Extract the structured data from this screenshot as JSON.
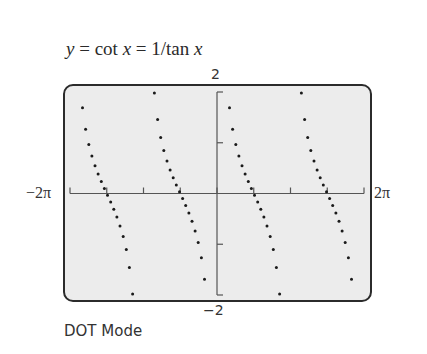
{
  "title_parts": {
    "y": "y",
    "eq1": " = cot ",
    "x1": "x",
    "eq2": " = 1/tan ",
    "x2": "x"
  },
  "caption": "DOT Mode",
  "axis_labels": {
    "ymax": "2",
    "ymin": "−2",
    "xmin": "−2π",
    "xmax": "2π"
  },
  "colors": {
    "screen_bg": "#ececec",
    "frame": "#2b2b2b",
    "axis": "#555555",
    "dot": "#1a1a1a"
  },
  "chart_data": {
    "type": "scatter",
    "title": "y = cot x = 1/tan x",
    "subtitle": "DOT Mode",
    "function": "cot(x)",
    "xlabel": "",
    "ylabel": "",
    "xlim": [
      -6.2832,
      6.2832
    ],
    "ylim": [
      -2,
      2
    ],
    "x_tick_labels": [
      "-2π",
      "2π"
    ],
    "y_tick_labels": [
      "-2",
      "2"
    ],
    "x_tick_step": "π/2",
    "y_tick_step": 1,
    "x_ticks": [
      -6.2832,
      -4.7124,
      -3.1416,
      -1.5708,
      0,
      1.5708,
      3.1416,
      4.7124,
      6.2832
    ],
    "y_ticks": [
      -2,
      -1,
      1,
      2
    ],
    "grid": false,
    "legend": null,
    "branches": 4,
    "vertical_asymptotes": [
      -6.2832,
      -3.1416,
      0,
      3.1416,
      6.2832
    ],
    "x_intercepts": [
      -4.7124,
      -1.5708,
      1.5708,
      4.7124
    ],
    "sample_points": [
      {
        "x": -5.8,
        "y": 2.0
      },
      {
        "x": -5.5,
        "y": 1.01
      },
      {
        "x": -5.2,
        "y": 0.56
      },
      {
        "x": -4.71,
        "y": 0.0
      },
      {
        "x": -4.3,
        "y": -0.44
      },
      {
        "x": -3.9,
        "y": -1.05
      },
      {
        "x": -3.6,
        "y": -2.0
      },
      {
        "x": -2.68,
        "y": 2.0
      },
      {
        "x": -2.36,
        "y": 1.0
      },
      {
        "x": -1.57,
        "y": 0.0
      },
      {
        "x": -0.79,
        "y": -1.0
      },
      {
        "x": -0.46,
        "y": -2.0
      },
      {
        "x": 0.46,
        "y": 2.0
      },
      {
        "x": 0.79,
        "y": 1.0
      },
      {
        "x": 1.57,
        "y": 0.0
      },
      {
        "x": 2.36,
        "y": -1.0
      },
      {
        "x": 2.68,
        "y": -2.0
      },
      {
        "x": 3.6,
        "y": 2.0
      },
      {
        "x": 3.93,
        "y": 1.0
      },
      {
        "x": 4.71,
        "y": 0.0
      },
      {
        "x": 5.5,
        "y": -1.0
      },
      {
        "x": 5.82,
        "y": -2.0
      }
    ],
    "plot_style": "dots"
  }
}
